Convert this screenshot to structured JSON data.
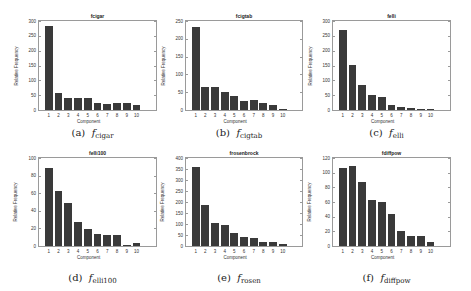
{
  "chart_data": [
    {
      "type": "bar",
      "title": "fcigar",
      "caption_letter": "(a)",
      "caption_sub": "cigar",
      "xlabel": "Component",
      "ylabel": "Relative Frequency",
      "categories": [
        "1",
        "2",
        "3",
        "4",
        "5",
        "6",
        "7",
        "8",
        "9",
        "10"
      ],
      "values": [
        283,
        59,
        42,
        40,
        41,
        24,
        21,
        25,
        23,
        16
      ],
      "yticks": [
        0,
        50,
        100,
        150,
        200,
        250,
        300
      ],
      "ylim": [
        0,
        300
      ],
      "xlim": [
        0,
        12
      ],
      "grid": false
    },
    {
      "type": "bar",
      "title": "fcigtab",
      "caption_letter": "(b)",
      "caption_sub": "cigtab",
      "xlabel": "Component",
      "ylabel": "Relative Frequency",
      "categories": [
        "1",
        "2",
        "3",
        "4",
        "5",
        "6",
        "7",
        "8",
        "9",
        "10"
      ],
      "values": [
        232,
        65,
        64,
        52,
        38,
        25,
        28,
        20,
        13,
        3
      ],
      "yticks": [
        0,
        50,
        100,
        150,
        200,
        250
      ],
      "ylim": [
        0,
        250
      ],
      "xlim": [
        0,
        12
      ],
      "grid": false
    },
    {
      "type": "bar",
      "title": "felli",
      "caption_letter": "(c)",
      "caption_sub": "elli",
      "xlabel": "Component",
      "ylabel": "Relative Frequency",
      "categories": [
        "1",
        "2",
        "3",
        "4",
        "5",
        "6",
        "7",
        "8",
        "9",
        "10"
      ],
      "values": [
        270,
        151,
        84,
        50,
        45,
        16,
        11,
        8,
        4,
        2
      ],
      "yticks": [
        0,
        50,
        100,
        150,
        200,
        250,
        300
      ],
      "ylim": [
        0,
        300
      ],
      "xlim": [
        0,
        12
      ],
      "grid": false
    },
    {
      "type": "bar",
      "title": "felli100",
      "caption_letter": "(d)",
      "caption_sub": "elli100",
      "xlabel": "Component",
      "ylabel": "Relative Frequency",
      "categories": [
        "1",
        "2",
        "3",
        "4",
        "5",
        "6",
        "7",
        "8",
        "9",
        "10"
      ],
      "values": [
        89,
        62,
        49,
        27,
        19,
        14,
        13,
        12,
        1,
        3
      ],
      "yticks": [
        0,
        20,
        40,
        60,
        80,
        100
      ],
      "ylim": [
        0,
        100
      ],
      "xlim": [
        0,
        12
      ],
      "grid": false
    },
    {
      "type": "bar",
      "title": "frosenbrock",
      "caption_letter": "(e)",
      "caption_sub": "rosen",
      "xlabel": "Component",
      "ylabel": "Relative Frequency",
      "categories": [
        "1",
        "2",
        "3",
        "4",
        "5",
        "6",
        "7",
        "8",
        "9",
        "10"
      ],
      "values": [
        361,
        185,
        104,
        95,
        61,
        39,
        36,
        18,
        17,
        8
      ],
      "yticks": [
        0,
        50,
        100,
        150,
        200,
        250,
        300,
        350,
        400
      ],
      "ylim": [
        0,
        400
      ],
      "xlim": [
        0,
        12
      ],
      "grid": false
    },
    {
      "type": "bar",
      "title": "fdiffpow",
      "caption_letter": "(f)",
      "caption_sub": "diffpow",
      "xlabel": "Component",
      "ylabel": "Relative Frequency",
      "categories": [
        "1",
        "2",
        "3",
        "4",
        "5",
        "6",
        "7",
        "8",
        "9",
        "10"
      ],
      "values": [
        107,
        109,
        87,
        63,
        60,
        43,
        20,
        14,
        13,
        6
      ],
      "yticks": [
        0,
        20,
        40,
        60,
        80,
        100,
        120
      ],
      "ylim": [
        0,
        120
      ],
      "xlim": [
        0,
        12
      ],
      "grid": false
    }
  ],
  "caption_prefix": "f",
  "layout": {
    "plots": [
      {
        "left": 38,
        "top": 20,
        "width": 119,
        "height": 91
      },
      {
        "left": 185,
        "top": 20,
        "width": 118,
        "height": 91
      },
      {
        "left": 332,
        "top": 20,
        "width": 119,
        "height": 91
      },
      {
        "left": 38,
        "top": 157,
        "width": 119,
        "height": 90
      },
      {
        "left": 185,
        "top": 157,
        "width": 118,
        "height": 90
      },
      {
        "left": 332,
        "top": 157,
        "width": 119,
        "height": 90
      }
    ],
    "captions_y": [
      127,
      127,
      127,
      272,
      272,
      272
    ],
    "bar_color": "#3a3a3a",
    "axis_color": "#9a9a9a"
  }
}
